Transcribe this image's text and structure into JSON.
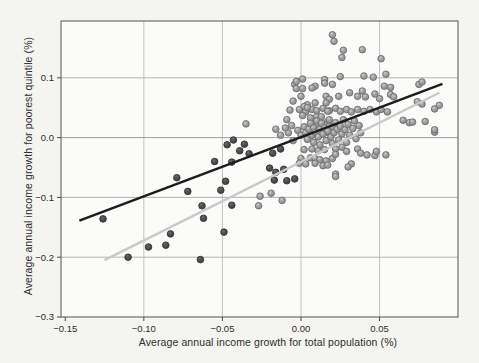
{
  "figure": {
    "x_axis_title": "Average annual income growth for total population (%)",
    "y_axis_title": "Average annual income growth for poorest quintile (%)"
  },
  "chart_data": {
    "type": "scatter",
    "title": "",
    "xlabel": "Average annual income growth for total population (%)",
    "ylabel": "Average annual income growth for poorest quintile (%)",
    "xlim": [
      -0.1527,
      0.0999
    ],
    "ylim": [
      -0.3,
      0.195
    ],
    "grid": "on",
    "legend": "none",
    "x_ticks": [
      {
        "v": -0.15,
        "label": "−0.15"
      },
      {
        "v": -0.1,
        "label": "−0.10"
      },
      {
        "v": -0.05,
        "label": "−0.05"
      },
      {
        "v": 0.0,
        "label": "0.00"
      },
      {
        "v": 0.05,
        "label": "0.05"
      }
    ],
    "y_ticks": [
      {
        "v": 0.1,
        "label": "0.1"
      },
      {
        "v": 0.0,
        "label": "0.0"
      },
      {
        "v": -0.1,
        "label": "−0.1"
      },
      {
        "v": -0.2,
        "label": "−0.2"
      },
      {
        "v": -0.3,
        "label": "−0.3"
      }
    ],
    "gridlines": {
      "vertical_x": [
        -0.1,
        -0.05,
        0.0,
        0.05
      ],
      "horizontal_y": [
        0.1,
        0.0,
        -0.1,
        -0.2
      ]
    },
    "colors": {
      "page_background": "#f4f4f1",
      "plot_background": "#fbfbf9",
      "border": "#6e6e6e",
      "grid_vertical": "#c2c2c2",
      "grid_horizontal": "#b2b2b2",
      "grid_zero_line": "#9f9f9f",
      "tick": "#4a4a4a",
      "tick_label": "#2d2d2d",
      "light_marker_fill": "#a0a0a0",
      "light_marker_edge": "#6e6e6e",
      "light_marker_highlight": "#cccccc",
      "dark_marker_fill": "#4e4e4e",
      "dark_marker_edge": "#373737",
      "black_line": "#1c1c1c",
      "gray_line": "#c9c9c9"
    },
    "lines": [
      {
        "name": "gray-regression-line",
        "color": "#c9c9c9",
        "width": 2.4,
        "from": [
          -0.125,
          -0.205
        ],
        "to": [
          0.088,
          0.075
        ]
      },
      {
        "name": "black-regression-line",
        "color": "#1c1c1c",
        "width": 2.4,
        "from": [
          -0.141,
          -0.139
        ],
        "to": [
          0.09,
          0.09
        ]
      }
    ],
    "series": [
      {
        "name": "light-gray-points",
        "marker": "circle-sphere",
        "points": [
          [
            0.02,
            0.172
          ],
          [
            0.021,
            0.161
          ],
          [
            0.027,
            0.146
          ],
          [
            0.039,
            0.147
          ],
          [
            0.026,
            0.134
          ],
          [
            0.051,
            0.132
          ],
          [
            -0.004,
            0.089
          ],
          [
            -0.003,
            0.082
          ],
          [
            0.001,
            0.082
          ],
          [
            0.009,
            0.086
          ],
          [
            0.015,
            0.097
          ],
          [
            0.02,
            0.089
          ],
          [
            0.025,
            0.102
          ],
          [
            0.04,
            0.103
          ],
          [
            0.046,
            0.101
          ],
          [
            0.054,
            0.106
          ],
          [
            0.053,
            0.086
          ],
          [
            0.057,
            0.084
          ],
          [
            0.075,
            0.089
          ],
          [
            0.077,
            0.093
          ],
          [
            -0.003,
            0.094
          ],
          [
            0.001,
            0.098
          ],
          [
            0.007,
            0.083
          ],
          [
            0.015,
            0.091
          ],
          [
            0.0,
            0.069
          ],
          [
            -0.005,
            0.061
          ],
          [
            0.004,
            0.055
          ],
          [
            0.009,
            0.058
          ],
          [
            0.016,
            0.069
          ],
          [
            0.018,
            0.064
          ],
          [
            0.024,
            0.069
          ],
          [
            0.031,
            0.075
          ],
          [
            0.036,
            0.069
          ],
          [
            0.039,
            0.078
          ],
          [
            0.041,
            0.068
          ],
          [
            0.047,
            0.073
          ],
          [
            0.05,
            0.065
          ],
          [
            0.057,
            0.072
          ],
          [
            0.059,
            0.068
          ],
          [
            0.074,
            0.06
          ],
          [
            0.077,
            0.056
          ],
          [
            0.088,
            0.054
          ],
          [
            0.016,
            0.058
          ],
          [
            0.085,
            0.048
          ],
          [
            -0.001,
            0.047
          ],
          [
            0.003,
            0.043
          ],
          [
            0.007,
            0.047
          ],
          [
            0.01,
            0.045
          ],
          [
            0.014,
            0.049
          ],
          [
            0.018,
            0.045
          ],
          [
            0.022,
            0.049
          ],
          [
            0.025,
            0.044
          ],
          [
            0.029,
            0.047
          ],
          [
            0.032,
            0.043
          ],
          [
            0.036,
            0.047
          ],
          [
            0.04,
            0.044
          ],
          [
            0.044,
            0.047
          ],
          [
            0.048,
            0.043
          ],
          [
            0.051,
            0.047
          ],
          [
            0.055,
            0.043
          ],
          [
            -0.009,
            0.03
          ],
          [
            -0.007,
            0.046
          ],
          [
            0.002,
            0.052
          ],
          [
            0.004,
            0.05
          ],
          [
            0.001,
            0.037
          ],
          [
            0.006,
            0.033
          ],
          [
            0.01,
            0.035
          ],
          [
            0.013,
            0.035
          ],
          [
            0.017,
            0.044
          ],
          [
            0.017,
            0.027
          ],
          [
            0.015,
            0.022
          ],
          [
            0.01,
            0.022
          ],
          [
            0.018,
            0.019
          ],
          [
            0.018,
            0.008
          ],
          [
            0.015,
            0.008
          ],
          [
            -0.035,
            0.023
          ],
          [
            0.065,
            0.029
          ],
          [
            0.069,
            0.025
          ],
          [
            0.071,
            0.026
          ],
          [
            0.085,
            0.009
          ],
          [
            0.085,
            0.013
          ],
          [
            0.079,
            0.027
          ],
          [
            0.002,
            -0.02
          ],
          [
            0.007,
            -0.019
          ],
          [
            0.011,
            -0.022
          ],
          [
            0.015,
            -0.02
          ],
          [
            0.006,
            -0.034
          ],
          [
            0.009,
            -0.035
          ],
          [
            0.012,
            -0.037
          ],
          [
            0.016,
            -0.039
          ],
          [
            0.02,
            -0.035
          ],
          [
            0.0,
            -0.035
          ],
          [
            -0.001,
            -0.043
          ],
          [
            0.003,
            -0.044
          ],
          [
            0.014,
            -0.047
          ],
          [
            0.017,
            -0.046
          ],
          [
            0.022,
            -0.019
          ],
          [
            0.026,
            -0.016
          ],
          [
            0.029,
            -0.023
          ],
          [
            0.022,
            -0.028
          ],
          [
            0.036,
            -0.019
          ],
          [
            0.042,
            -0.029
          ],
          [
            0.032,
            -0.044
          ],
          [
            0.022,
            -0.061
          ],
          [
            0.047,
            -0.03
          ],
          [
            0.038,
            -0.026
          ],
          [
            0.048,
            -0.023
          ],
          [
            0.054,
            -0.029
          ],
          [
            0.03,
            -0.049
          ],
          [
            0.022,
            -0.065
          ],
          [
            0.009,
            -0.043
          ],
          [
            -0.019,
            -0.093
          ],
          [
            -0.012,
            -0.105
          ],
          [
            -0.026,
            -0.098
          ],
          [
            -0.027,
            -0.114
          ],
          [
            -0.002,
            0.012
          ],
          [
            0.0,
            0.004
          ],
          [
            0.002,
            0.018
          ],
          [
            0.003,
            0.008
          ],
          [
            0.004,
            -0.003
          ],
          [
            0.005,
            0.014
          ],
          [
            0.006,
            0.024
          ],
          [
            0.007,
            0.004
          ],
          [
            0.008,
            0.016
          ],
          [
            0.008,
            -0.008
          ],
          [
            0.009,
            0.009
          ],
          [
            0.01,
            0.028
          ],
          [
            0.011,
            0.001
          ],
          [
            0.012,
            0.014
          ],
          [
            0.012,
            -0.012
          ],
          [
            0.013,
            0.024
          ],
          [
            0.014,
            0.006
          ],
          [
            0.015,
            0.016
          ],
          [
            0.016,
            -0.005
          ],
          [
            0.017,
            0.011
          ],
          [
            0.018,
            0.03
          ],
          [
            0.019,
            0.001
          ],
          [
            0.02,
            0.018
          ],
          [
            0.02,
            -0.01
          ],
          [
            0.021,
            0.008
          ],
          [
            0.022,
            0.025
          ],
          [
            0.023,
            0.014
          ],
          [
            0.024,
            -0.004
          ],
          [
            0.025,
            0.019
          ],
          [
            0.026,
            0.006
          ],
          [
            0.027,
            0.03
          ],
          [
            0.028,
            0.013
          ],
          [
            0.029,
            -0.008
          ],
          [
            0.03,
            0.022
          ],
          [
            0.031,
            0.004
          ],
          [
            0.033,
            0.015
          ],
          [
            0.034,
            0.028
          ],
          [
            0.035,
            -0.002
          ],
          [
            0.037,
            0.02
          ],
          [
            0.038,
            0.008
          ],
          [
            -0.006,
            0.02
          ],
          [
            -0.008,
            0.008
          ],
          [
            -0.005,
            -0.005
          ],
          [
            -0.01,
            0.016
          ],
          [
            -0.013,
            0.004
          ],
          [
            -0.016,
            0.014
          ]
        ]
      },
      {
        "name": "dark-gray-points",
        "marker": "circle-sphere",
        "points": [
          [
            -0.126,
            -0.136
          ],
          [
            -0.11,
            -0.2
          ],
          [
            -0.097,
            -0.183
          ],
          [
            -0.086,
            -0.18
          ],
          [
            -0.083,
            -0.161
          ],
          [
            -0.079,
            -0.067
          ],
          [
            -0.072,
            -0.09
          ],
          [
            -0.064,
            -0.204
          ],
          [
            -0.063,
            -0.114
          ],
          [
            -0.062,
            -0.135
          ],
          [
            -0.055,
            -0.04
          ],
          [
            -0.051,
            -0.088
          ],
          [
            -0.049,
            -0.158
          ],
          [
            -0.048,
            -0.073
          ],
          [
            -0.047,
            -0.012
          ],
          [
            -0.044,
            -0.041
          ],
          [
            -0.044,
            -0.113
          ],
          [
            -0.043,
            -0.004
          ],
          [
            -0.039,
            -0.022
          ],
          [
            -0.036,
            -0.011
          ],
          [
            -0.033,
            -0.027
          ],
          [
            -0.02,
            -0.051
          ],
          [
            -0.018,
            -0.026
          ],
          [
            -0.017,
            -0.071
          ],
          [
            -0.016,
            -0.058
          ],
          [
            -0.013,
            -0.019
          ],
          [
            -0.011,
            -0.053
          ],
          [
            -0.009,
            -0.072
          ],
          [
            -0.004,
            -0.069
          ]
        ]
      }
    ]
  }
}
